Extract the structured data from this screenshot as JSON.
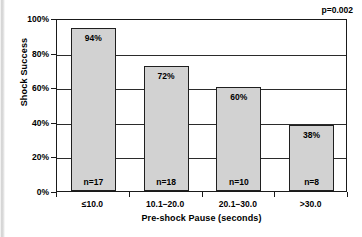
{
  "chart_data": {
    "type": "bar",
    "title": "",
    "xlabel": "Pre-shock Pause (seconds)",
    "ylabel": "Shock Success",
    "categories": [
      "≤10.0",
      "10.1−20.0",
      "20.1−30.0",
      ">30.0"
    ],
    "values": [
      94,
      72,
      60,
      38
    ],
    "value_labels": [
      "94%",
      "72%",
      "60%",
      "38%"
    ],
    "counts": [
      "n=17",
      "n=18",
      "n=10",
      "n=8"
    ],
    "n_values": [
      17,
      18,
      10,
      8
    ],
    "ylim": [
      0,
      100
    ],
    "yticks": [
      0,
      20,
      40,
      60,
      80,
      100
    ],
    "ytick_labels": [
      "0%",
      "20%",
      "40%",
      "60%",
      "80%",
      "100%"
    ],
    "grid": true,
    "legend": "none",
    "annotations": [
      {
        "name": "p-value",
        "text": "p=0.002",
        "position": "top-right"
      }
    ],
    "colors": {
      "bar_fill": "#d2d2d2",
      "bar_border": "#1f1f1f",
      "axis": "#1a1a1a",
      "gridline": "#2b2b2b",
      "text": "#000000",
      "background": "#ffffff"
    }
  }
}
